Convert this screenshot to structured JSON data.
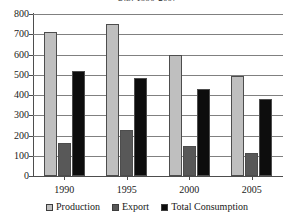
{
  "chart_data": {
    "type": "bar",
    "title": "U.S. 1990-2007",
    "xlabel": "",
    "ylabel": "",
    "categories": [
      "1990",
      "1995",
      "2000",
      "2005"
    ],
    "series": [
      {
        "name": "Production",
        "color": "#bfbfbf",
        "values": [
          710,
          750,
          600,
          495
        ]
      },
      {
        "name": "Export",
        "color": "#585858",
        "values": [
          165,
          225,
          150,
          115
        ]
      },
      {
        "name": "Total Consumption",
        "color": "#0d0d0d",
        "values": [
          520,
          485,
          430,
          380
        ]
      }
    ],
    "ylim": [
      0,
      800
    ],
    "yticks": [
      0,
      100,
      200,
      300,
      400,
      500,
      600,
      700,
      800
    ],
    "ytick_labels": [
      "0",
      "100",
      "200",
      "300",
      "400",
      "500",
      "600",
      "700",
      "800"
    ],
    "grid": true,
    "legend_position": "bottom"
  },
  "legend": {
    "items": [
      {
        "label": "Production"
      },
      {
        "label": "Export"
      },
      {
        "label": "Total Consumption"
      }
    ]
  }
}
